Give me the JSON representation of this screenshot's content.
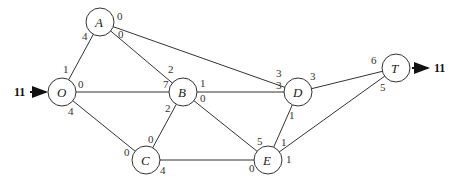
{
  "diagram": {
    "type": "network-flow",
    "source_flow": "11",
    "sink_flow": "11",
    "nodes": [
      {
        "id": "A",
        "label": "A",
        "x": 100,
        "y": 22
      },
      {
        "id": "O",
        "label": "O",
        "x": 62,
        "y": 92
      },
      {
        "id": "B",
        "label": "B",
        "x": 183,
        "y": 92
      },
      {
        "id": "C",
        "label": "C",
        "x": 146,
        "y": 160
      },
      {
        "id": "D",
        "label": "D",
        "x": 298,
        "y": 92
      },
      {
        "id": "E",
        "label": "E",
        "x": 268,
        "y": 160
      },
      {
        "id": "T",
        "label": "T",
        "x": 396,
        "y": 68
      }
    ],
    "edges": [
      {
        "from": "O",
        "to": "A",
        "from_label": "1",
        "to_label": "4"
      },
      {
        "from": "A",
        "to": "B",
        "from_label": "0",
        "to_label": "2"
      },
      {
        "from": "A",
        "to": "D",
        "from_label": "0",
        "to_label": "3"
      },
      {
        "from": "O",
        "to": "B",
        "from_label": "0",
        "to_label": "7"
      },
      {
        "from": "O",
        "to": "C",
        "from_label": "4",
        "to_label": "0"
      },
      {
        "from": "B",
        "to": "C",
        "from_label": "2",
        "to_label": "0"
      },
      {
        "from": "B",
        "to": "D",
        "from_label": "1",
        "to_label": "3"
      },
      {
        "from": "B",
        "to": "E",
        "from_label": "0",
        "to_label": "5"
      },
      {
        "from": "C",
        "to": "E",
        "from_label": "4",
        "to_label": "0"
      },
      {
        "from": "D",
        "to": "E",
        "from_label": "1",
        "to_label": "1"
      },
      {
        "from": "D",
        "to": "T",
        "from_label": "3",
        "to_label": "6"
      },
      {
        "from": "E",
        "to": "T",
        "from_label": "1",
        "to_label": "5"
      }
    ]
  }
}
